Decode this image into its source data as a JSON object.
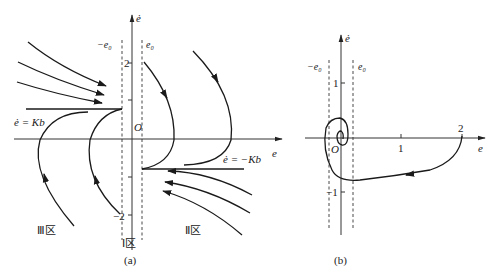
{
  "figure": {
    "panel_a": {
      "caption": "(a)",
      "y_axis_label": "ė",
      "x_axis_label": "e",
      "origin_label": "O",
      "boundary_left_label": "−e₀",
      "boundary_right_label": "e₀",
      "tick_top_label": "2",
      "tick_bottom_label": "−2",
      "switch_line_upper_label": "ė = Kb",
      "switch_line_lower_label": "ė = −Kb",
      "region_I_label": "Ⅰ区",
      "region_II_label": "Ⅱ区",
      "region_III_label": "Ⅲ区"
    },
    "panel_b": {
      "caption": "(b)",
      "y_axis_label": "ė",
      "x_axis_label": "e",
      "origin_label": "O",
      "boundary_left_label": "−e₀",
      "boundary_right_label": "e₀",
      "tick_x1_label": "1",
      "tick_x2_label": "2",
      "tick_y1_label": "1",
      "tick_ym1_label": "−1"
    },
    "colors": {
      "line": "#1a1a1a",
      "background": "#ffffff"
    }
  }
}
